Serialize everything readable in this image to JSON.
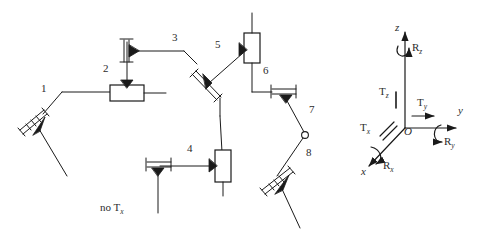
{
  "figure": {
    "type": "kinematic-chain-diagram",
    "stroke_color": "#1a1a1a",
    "text_color": "#2b2b2b",
    "background": "#ffffff",
    "width": 481,
    "height": 243
  },
  "note": {
    "prefix": "no",
    "symbol": "T",
    "subscript": "x",
    "full": "no Tx",
    "x": 103,
    "y": 209
  },
  "joint_labels": [
    {
      "id": "1",
      "text": "1",
      "x": 41,
      "y": 88
    },
    {
      "id": "2",
      "text": "2",
      "x": 104,
      "y": 68
    },
    {
      "id": "3",
      "text": "3",
      "x": 172,
      "y": 37
    },
    {
      "id": "4",
      "text": "4",
      "x": 187,
      "y": 148
    },
    {
      "id": "5",
      "text": "5",
      "x": 215,
      "y": 44
    },
    {
      "id": "6",
      "text": "6",
      "x": 263,
      "y": 70
    },
    {
      "id": "7",
      "text": "7",
      "x": 309,
      "y": 109
    },
    {
      "id": "8",
      "text": "8",
      "x": 306,
      "y": 152
    }
  ],
  "frame": {
    "origin_label": "O",
    "origin": {
      "x": 405,
      "y": 128
    },
    "axes": [
      {
        "name": "z-axis",
        "label": "z",
        "label_x": 398,
        "label_y": 25
      },
      {
        "name": "y-axis",
        "label": "y",
        "label_x": 459,
        "label_y": 110
      },
      {
        "name": "x-axis",
        "label": "x",
        "label_x": 362,
        "label_y": 173
      }
    ],
    "translations": [
      {
        "name": "Tz",
        "symbol": "T",
        "subscript": "z",
        "x": 382,
        "y": 93
      },
      {
        "name": "Ty",
        "symbol": "T",
        "subscript": "y",
        "x": 424,
        "y": 103
      },
      {
        "name": "Tx",
        "symbol": "T",
        "subscript": "x",
        "x": 366,
        "y": 128
      }
    ],
    "rotations": [
      {
        "name": "Rz",
        "symbol": "R",
        "subscript": "z",
        "x": 413,
        "y": 47
      },
      {
        "name": "Ry",
        "symbol": "R",
        "subscript": "y",
        "x": 446,
        "y": 141
      },
      {
        "name": "Rx",
        "symbol": "R",
        "subscript": "x",
        "x": 385,
        "y": 166
      }
    ]
  },
  "elements": {
    "prismatic_joints": [
      {
        "name": "prismatic-joint-1",
        "orientation": "diagonal",
        "x": 22,
        "y": 118
      },
      {
        "name": "prismatic-joint-3",
        "orientation": "vertical",
        "x": 122,
        "y": 32
      },
      {
        "name": "prismatic-joint-5",
        "orientation": "diagonal",
        "x": 199,
        "y": 85
      },
      {
        "name": "prismatic-joint-4",
        "orientation": "horizontal",
        "x": 164,
        "y": 161
      },
      {
        "name": "prismatic-joint-6",
        "orientation": "horizontal",
        "x": 281,
        "y": 92
      },
      {
        "name": "prismatic-joint-8",
        "orientation": "diagonal",
        "x": 274,
        "y": 183
      }
    ],
    "box_links": [
      {
        "name": "box-link-2",
        "orientation": "horizontal",
        "x": 112,
        "y": 85
      },
      {
        "name": "box-link-5",
        "orientation": "vertical",
        "x": 245,
        "y": 33
      },
      {
        "name": "box-link-4",
        "orientation": "vertical",
        "x": 216,
        "y": 150
      }
    ],
    "revolute_joints": [
      {
        "name": "revolute-joint-7",
        "x": 305,
        "y": 135
      }
    ]
  }
}
